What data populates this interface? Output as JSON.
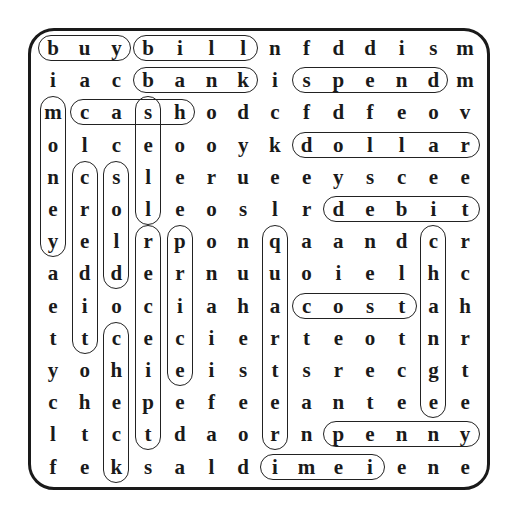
{
  "puzzle": {
    "type": "word-search",
    "rows": 14,
    "cols": 14,
    "grid": [
      [
        "b",
        "u",
        "y",
        "b",
        "i",
        "l",
        "l",
        "n",
        "f",
        "d",
        "d",
        "i",
        "s",
        "m"
      ],
      [
        "i",
        "a",
        "c",
        "b",
        "a",
        "n",
        "k",
        "i",
        "s",
        "p",
        "e",
        "n",
        "d",
        "m"
      ],
      [
        "m",
        "c",
        "a",
        "s",
        "h",
        "o",
        "d",
        "c",
        "f",
        "d",
        "f",
        "e",
        "o",
        "v"
      ],
      [
        "o",
        "l",
        "c",
        "e",
        "o",
        "o",
        "y",
        "k",
        "d",
        "o",
        "l",
        "l",
        "a",
        "r"
      ],
      [
        "n",
        "c",
        "s",
        "l",
        "e",
        "r",
        "u",
        "e",
        "e",
        "y",
        "s",
        "c",
        "e",
        "e"
      ],
      [
        "e",
        "r",
        "o",
        "l",
        "e",
        "o",
        "s",
        "l",
        "r",
        "d",
        "e",
        "b",
        "i",
        "t"
      ],
      [
        "y",
        "e",
        "l",
        "r",
        "p",
        "o",
        "n",
        "q",
        "a",
        "a",
        "n",
        "d",
        "c",
        "r"
      ],
      [
        "a",
        "d",
        "d",
        "e",
        "r",
        "n",
        "u",
        "u",
        "o",
        "i",
        "e",
        "l",
        "h",
        "c"
      ],
      [
        "e",
        "i",
        "o",
        "c",
        "i",
        "a",
        "h",
        "a",
        "c",
        "o",
        "s",
        "t",
        "a",
        "h"
      ],
      [
        "t",
        "t",
        "c",
        "e",
        "c",
        "i",
        "e",
        "r",
        "t",
        "e",
        "o",
        "t",
        "n",
        "r"
      ],
      [
        "y",
        "o",
        "h",
        "i",
        "e",
        "i",
        "s",
        "t",
        "s",
        "r",
        "e",
        "c",
        "g",
        "t"
      ],
      [
        "c",
        "h",
        "e",
        "p",
        "e",
        "f",
        "e",
        "e",
        "a",
        "n",
        "t",
        "e",
        "e",
        "e"
      ],
      [
        "l",
        "t",
        "c",
        "t",
        "d",
        "a",
        "o",
        "r",
        "n",
        "p",
        "e",
        "n",
        "n",
        "y"
      ],
      [
        "f",
        "e",
        "k",
        "s",
        "a",
        "l",
        "d",
        "i",
        "m",
        "e",
        "i",
        "e",
        "n",
        "e"
      ]
    ],
    "found_words": [
      {
        "word": "buy",
        "row": 0,
        "col": 0,
        "dir": "h",
        "len": 3
      },
      {
        "word": "bill",
        "row": 0,
        "col": 3,
        "dir": "h",
        "len": 4
      },
      {
        "word": "bank",
        "row": 1,
        "col": 3,
        "dir": "h",
        "len": 4
      },
      {
        "word": "spend",
        "row": 1,
        "col": 8,
        "dir": "h",
        "len": 5
      },
      {
        "word": "cash",
        "row": 2,
        "col": 1,
        "dir": "h",
        "len": 4
      },
      {
        "word": "dollar",
        "row": 3,
        "col": 8,
        "dir": "h",
        "len": 6
      },
      {
        "word": "debit",
        "row": 5,
        "col": 9,
        "dir": "h",
        "len": 5
      },
      {
        "word": "cost",
        "row": 8,
        "col": 8,
        "dir": "h",
        "len": 4
      },
      {
        "word": "penny",
        "row": 12,
        "col": 9,
        "dir": "h",
        "len": 5
      },
      {
        "word": "dime",
        "row": 13,
        "col": 7,
        "dir": "h",
        "len": 4
      },
      {
        "word": "money",
        "row": 2,
        "col": 0,
        "dir": "v",
        "len": 5
      },
      {
        "word": "credit",
        "row": 4,
        "col": 1,
        "dir": "v",
        "len": 6
      },
      {
        "word": "sold",
        "row": 4,
        "col": 2,
        "dir": "v",
        "len": 4
      },
      {
        "word": "sell",
        "row": 2,
        "col": 3,
        "dir": "v",
        "len": 4
      },
      {
        "word": "receipt",
        "row": 6,
        "col": 3,
        "dir": "v",
        "len": 7
      },
      {
        "word": "price",
        "row": 6,
        "col": 4,
        "dir": "v",
        "len": 5
      },
      {
        "word": "check",
        "row": 9,
        "col": 2,
        "dir": "v",
        "len": 5
      },
      {
        "word": "quarter",
        "row": 6,
        "col": 7,
        "dir": "v",
        "len": 7
      },
      {
        "word": "change",
        "row": 6,
        "col": 12,
        "dir": "v",
        "len": 6
      }
    ]
  },
  "colors": {
    "ink": "#1a1a1a",
    "background": "#ffffff"
  }
}
